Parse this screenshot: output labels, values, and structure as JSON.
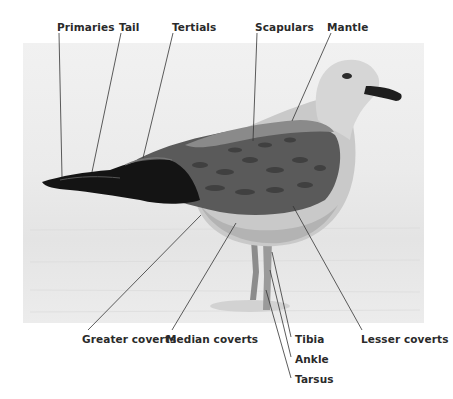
{
  "diagram": {
    "photo": {
      "background": "#ebebeb",
      "tone": "grayscale"
    },
    "labels_top": [
      {
        "id": "primaries",
        "text": "Primaries"
      },
      {
        "id": "tail",
        "text": "Tail"
      },
      {
        "id": "tertials",
        "text": "Tertials"
      },
      {
        "id": "scapulars",
        "text": "Scapulars"
      },
      {
        "id": "mantle",
        "text": "Mantle"
      }
    ],
    "labels_bottom": [
      {
        "id": "greater-coverts",
        "text": "Greater coverts"
      },
      {
        "id": "median-coverts",
        "text": "Median coverts"
      },
      {
        "id": "tibia",
        "text": "Tibia"
      },
      {
        "id": "ankle",
        "text": "Ankle"
      },
      {
        "id": "tarsus",
        "text": "Tarsus"
      },
      {
        "id": "lesser-coverts",
        "text": "Lesser coverts"
      }
    ],
    "colors": {
      "label_text": "#2a2a2a",
      "leader_line": "#333333"
    }
  }
}
